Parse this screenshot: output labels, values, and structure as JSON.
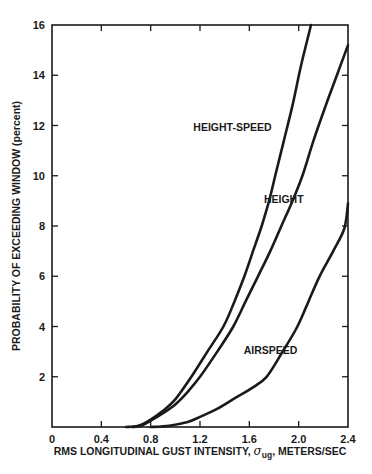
{
  "chart_data": {
    "type": "line",
    "title": "",
    "xlabel": "RMS LONGITUDINAL GUST INTENSITY, σug, METERS/SEC",
    "xlabel_parts": {
      "prefix": "RMS LONGITUDINAL GUST INTENSITY, ",
      "sigma": "σ",
      "subscript": "ug",
      "suffix": ", METERS/SEC"
    },
    "ylabel": "PROBABILITY OF EXCEEDING WINDOW (percent)",
    "xlim": [
      0,
      2.4
    ],
    "ylim": [
      0,
      16
    ],
    "x_ticks": [
      "0",
      "0.4",
      "0.8",
      "1.2",
      "1.6",
      "2.0",
      "2.4"
    ],
    "x_tick_values": [
      0,
      0.4,
      0.8,
      1.2,
      1.6,
      2.0,
      2.4
    ],
    "y_ticks": [
      "2",
      "4",
      "6",
      "8",
      "10",
      "12",
      "14",
      "16"
    ],
    "y_tick_values": [
      2,
      4,
      6,
      8,
      10,
      12,
      14,
      16
    ],
    "y_zero_label": "0",
    "grid": false,
    "legend": "inline curve labels",
    "series": [
      {
        "name": "HEIGHT-SPEED",
        "label_pos": [
          1.78,
          11.8
        ],
        "points": [
          [
            0.6,
            0
          ],
          [
            0.7,
            0.05
          ],
          [
            0.8,
            0.3
          ],
          [
            0.9,
            0.65
          ],
          [
            1.0,
            1.1
          ],
          [
            1.13,
            2.0
          ],
          [
            1.26,
            3.0
          ],
          [
            1.39,
            4.0
          ],
          [
            1.48,
            5.0
          ],
          [
            1.56,
            6.0
          ],
          [
            1.63,
            7.0
          ],
          [
            1.7,
            8.0
          ],
          [
            1.76,
            9.0
          ],
          [
            1.81,
            10.0
          ],
          [
            1.88,
            11.4
          ],
          [
            1.95,
            12.8
          ],
          [
            2.02,
            14.4
          ],
          [
            2.1,
            16.0
          ]
        ]
      },
      {
        "name": "HEIGHT",
        "label_pos": [
          2.04,
          8.9
        ],
        "points": [
          [
            0.65,
            0
          ],
          [
            0.72,
            0.05
          ],
          [
            0.8,
            0.25
          ],
          [
            0.9,
            0.55
          ],
          [
            1.0,
            0.9
          ],
          [
            1.1,
            1.4
          ],
          [
            1.2,
            2.0
          ],
          [
            1.34,
            3.0
          ],
          [
            1.47,
            4.0
          ],
          [
            1.57,
            5.0
          ],
          [
            1.67,
            6.0
          ],
          [
            1.77,
            7.0
          ],
          [
            1.86,
            8.0
          ],
          [
            1.95,
            9.0
          ],
          [
            2.03,
            10.0
          ],
          [
            2.12,
            11.4
          ],
          [
            2.22,
            12.8
          ],
          [
            2.31,
            14.0
          ],
          [
            2.4,
            15.2
          ]
        ]
      },
      {
        "name": "AIRSPEED",
        "label_pos": [
          1.99,
          2.9
        ],
        "points": [
          [
            0.8,
            0
          ],
          [
            0.95,
            0.05
          ],
          [
            1.1,
            0.2
          ],
          [
            1.2,
            0.4
          ],
          [
            1.35,
            0.75
          ],
          [
            1.5,
            1.2
          ],
          [
            1.62,
            1.55
          ],
          [
            1.74,
            2.0
          ],
          [
            1.87,
            3.0
          ],
          [
            1.99,
            4.0
          ],
          [
            2.08,
            5.0
          ],
          [
            2.17,
            6.0
          ],
          [
            2.28,
            7.0
          ],
          [
            2.37,
            7.9
          ],
          [
            2.4,
            8.9
          ]
        ]
      }
    ]
  },
  "colors": {
    "ink": "#1a1a1a",
    "background": "#ffffff"
  }
}
